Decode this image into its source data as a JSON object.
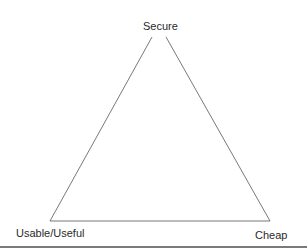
{
  "diagram": {
    "type": "triangle",
    "vertices": {
      "top": {
        "label": "Secure"
      },
      "bottom_left": {
        "label": "Usable/Useful"
      },
      "bottom_right": {
        "label": "Cheap"
      }
    },
    "line_color": "#555555",
    "text_color": "#2a2a2a"
  }
}
